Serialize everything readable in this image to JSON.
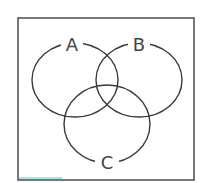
{
  "diagram": {
    "type": "venn",
    "set_count": 3,
    "sets": [
      {
        "id": "A",
        "label": "A",
        "cx": 75,
        "cy": 80,
        "rx": 43,
        "ry": 37,
        "label_x": 72,
        "label_y": 44
      },
      {
        "id": "B",
        "label": "B",
        "cx": 139,
        "cy": 80,
        "rx": 43,
        "ry": 37,
        "label_x": 139,
        "label_y": 44
      },
      {
        "id": "C",
        "label": "C",
        "cx": 107,
        "cy": 124,
        "rx": 43,
        "ry": 39,
        "label_x": 107,
        "label_y": 162
      }
    ],
    "frame": {
      "x": 18,
      "y": 18,
      "width": 176,
      "height": 162
    },
    "colors": {
      "stroke": "#3a3a3a",
      "frame": "#555555",
      "label": "#444444",
      "accent": "#7fe6ee"
    }
  }
}
